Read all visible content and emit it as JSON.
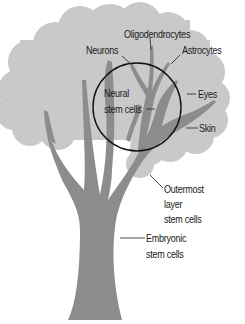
{
  "diagram": {
    "type": "stem-cell-tree",
    "colors": {
      "canopy": "#c9c9c9",
      "trunk": "#8c8c8c",
      "circle_stroke": "#111111",
      "leader_line": "#333333",
      "text": "#1a1a1a",
      "background": "#ffffff"
    },
    "labels": {
      "oligodendrocytes": "Oligodendrocytes",
      "neurons": "Neurons",
      "astrocytes": "Astrocytes",
      "neural_line1": "Neural",
      "neural_line2": "stem cells",
      "eyes": "Eyes",
      "skin": "Skin",
      "outermost_line1": "Outermost",
      "outermost_line2": "layer",
      "outermost_line3": "stem cells",
      "embryonic_line1": "Embryonic",
      "embryonic_line2": "stem cells"
    }
  }
}
